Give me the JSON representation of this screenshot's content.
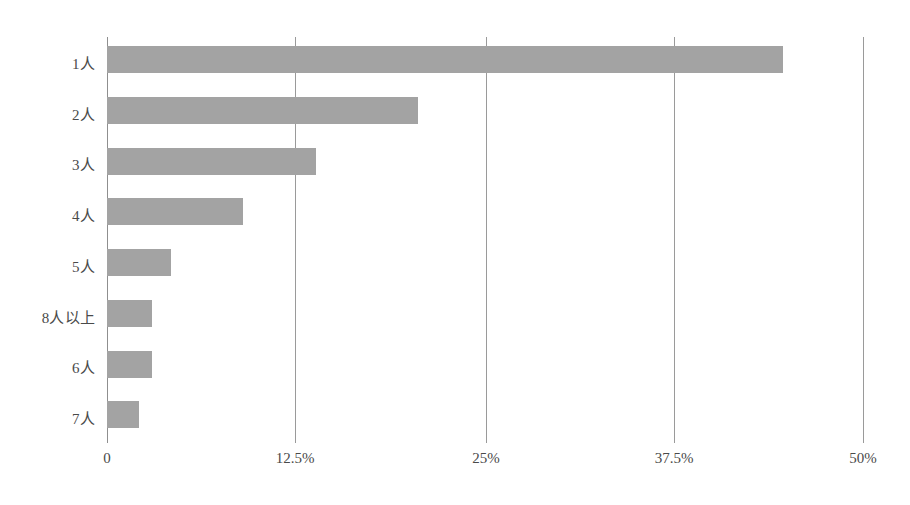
{
  "chart_data": {
    "type": "bar",
    "orientation": "horizontal",
    "title": "",
    "subtitle": "",
    "xlabel": "",
    "ylabel": "",
    "categories": [
      "1人",
      "2人",
      "3人",
      "4人",
      "5人",
      "8人以上",
      "6人",
      "7人"
    ],
    "values": [
      44.7,
      20.6,
      13.8,
      9.0,
      4.2,
      3.0,
      3.0,
      2.1
    ],
    "value_unit": "%",
    "xlim": [
      0,
      50
    ],
    "ylim": null,
    "x_ticks": [
      0,
      12.5,
      25,
      37.5,
      50
    ],
    "x_tick_labels": [
      "0",
      "12.5%",
      "25%",
      "37.5%",
      "50%"
    ],
    "grid": "vertical",
    "legend": null,
    "legend_position": "none",
    "series": [
      {
        "name": "",
        "color": "#a3a3a3",
        "values": [
          44.7,
          20.6,
          13.8,
          9.0,
          4.2,
          3.0,
          3.0,
          2.1
        ]
      }
    ],
    "annotations": []
  },
  "style": {
    "background": "#ffffff",
    "bar_color": "#a3a3a3",
    "gridline_color": "#9a9a9a",
    "axis_color": "#8f8f8f",
    "text_color": "#4a4a4a"
  }
}
